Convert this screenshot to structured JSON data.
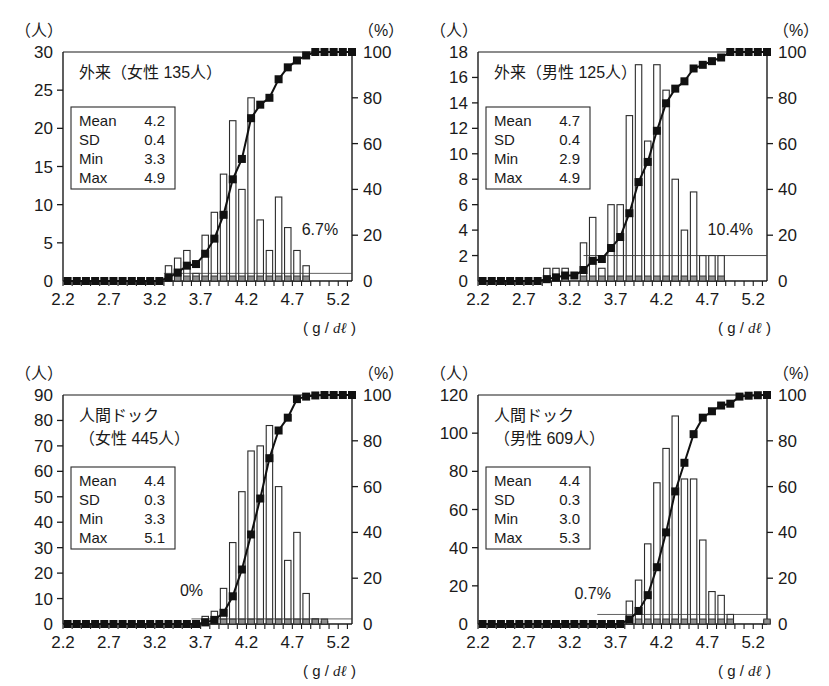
{
  "figure": {
    "panel_count": 4,
    "x_unit_label": "( g / dℓ )",
    "left_axis_unit": "（人）",
    "right_axis_unit": "（%）"
  },
  "chart_data": [
    {
      "type": "bar",
      "id": "outpatient-female",
      "title": "外来（女性 135人）",
      "title_lines": [
        "外来（女性 135人）"
      ],
      "xlabel": "( g / dℓ )",
      "ylabel": "（人）",
      "y2label": "（%）",
      "xlim": [
        2.2,
        5.35
      ],
      "ylim": [
        0,
        30
      ],
      "y2lim": [
        0,
        100
      ],
      "yticks": [
        0,
        5,
        10,
        15,
        20,
        25,
        30
      ],
      "y2ticks": [
        0,
        20,
        40,
        60,
        80,
        100
      ],
      "xticks_labeled": [
        "2.2",
        "2.7",
        "3.2",
        "3.7",
        "4.2",
        "4.7",
        "5.2"
      ],
      "xtick_step": 0.1,
      "grid": false,
      "annotation": "6.7%",
      "annotation_x": 5.0,
      "annotation_y": 6.0,
      "stats": {
        "Mean": "4.2",
        "SD": "0.4",
        "Min": "3.3",
        "Max": "4.9"
      },
      "stats_rows": [
        {
          "label": "Mean",
          "value": "4.2"
        },
        {
          "label": "SD",
          "value": "0.4"
        },
        {
          "label": "Min",
          "value": "3.3"
        },
        {
          "label": "Max",
          "value": "4.9"
        }
      ],
      "x": [
        2.2,
        2.3,
        2.4,
        2.5,
        2.6,
        2.7,
        2.8,
        2.9,
        3.0,
        3.1,
        3.2,
        3.3,
        3.4,
        3.5,
        3.6,
        3.7,
        3.8,
        3.9,
        4.0,
        4.1,
        4.2,
        4.3,
        4.4,
        4.5,
        4.6,
        4.7,
        4.8,
        4.9,
        5.0,
        5.1,
        5.2,
        5.3
      ],
      "values": [
        0,
        0,
        0,
        0,
        0,
        0,
        0,
        0,
        0,
        0,
        0,
        2,
        3,
        4,
        1,
        6,
        9,
        14,
        21,
        12,
        24,
        8,
        4,
        11,
        7,
        4,
        2,
        0,
        0,
        0,
        0,
        0
      ],
      "cumulative_percent": [
        0,
        0,
        0,
        0,
        0,
        0,
        0,
        0,
        0,
        0,
        0,
        1.5,
        3.7,
        6.7,
        7.4,
        11.9,
        18.5,
        28.9,
        44.4,
        53.3,
        71.1,
        77.0,
        80.0,
        88.1,
        93.3,
        96.3,
        98.5,
        100,
        100,
        100,
        100,
        100
      ],
      "series": [
        {
          "name": "人数 (frequency)",
          "type": "bar",
          "axis": "left"
        },
        {
          "name": "累積 (%)",
          "type": "line",
          "axis": "right",
          "marker": "filled-square"
        }
      ]
    },
    {
      "type": "bar",
      "id": "outpatient-male",
      "title": "外来（男性 125人）",
      "title_lines": [
        "外来（男性 125人）"
      ],
      "xlabel": "( g / dℓ )",
      "ylabel": "（人）",
      "y2label": "（%）",
      "xlim": [
        2.2,
        5.35
      ],
      "ylim": [
        0,
        18
      ],
      "y2lim": [
        0,
        100
      ],
      "yticks": [
        0,
        2,
        4,
        6,
        8,
        10,
        12,
        14,
        16,
        18
      ],
      "y2ticks": [
        0,
        20,
        40,
        60,
        80,
        100
      ],
      "xticks_labeled": [
        "2.2",
        "2.7",
        "3.2",
        "3.7",
        "4.2",
        "4.7",
        "5.2"
      ],
      "xtick_step": 0.1,
      "grid": false,
      "annotation": "10.4%",
      "annotation_x": 4.95,
      "annotation_y": 3.6,
      "stats": {
        "Mean": "4.7",
        "SD": "0.4",
        "Min": "2.9",
        "Max": "4.9"
      },
      "stats_rows": [
        {
          "label": "Mean",
          "value": "4.7"
        },
        {
          "label": "SD",
          "value": "0.4"
        },
        {
          "label": "Min",
          "value": "2.9"
        },
        {
          "label": "Max",
          "value": "4.9"
        }
      ],
      "x": [
        2.2,
        2.3,
        2.4,
        2.5,
        2.6,
        2.7,
        2.8,
        2.9,
        3.0,
        3.1,
        3.2,
        3.3,
        3.4,
        3.5,
        3.6,
        3.7,
        3.8,
        3.9,
        4.0,
        4.1,
        4.2,
        4.3,
        4.4,
        4.5,
        4.6,
        4.7,
        4.8,
        4.9,
        5.0,
        5.1,
        5.2,
        5.3
      ],
      "values": [
        0,
        0,
        0,
        0,
        0,
        0,
        0,
        1,
        1,
        1,
        0,
        3,
        5,
        1,
        6,
        6,
        13,
        17,
        11,
        17,
        15,
        8,
        4,
        7,
        2,
        2,
        2,
        0,
        0,
        0,
        0,
        0
      ],
      "cumulative_percent": [
        0,
        0,
        0,
        0,
        0,
        0,
        0,
        0.8,
        1.6,
        2.4,
        2.4,
        4.8,
        8.8,
        9.6,
        14.4,
        19.2,
        29.6,
        43.2,
        52.0,
        65.6,
        77.6,
        84.0,
        87.2,
        92.8,
        94.4,
        96.0,
        97.6,
        100,
        100,
        100,
        100,
        100
      ],
      "series": [
        {
          "name": "人数 (frequency)",
          "type": "bar",
          "axis": "left"
        },
        {
          "name": "累積 (%)",
          "type": "line",
          "axis": "right",
          "marker": "filled-square"
        }
      ]
    },
    {
      "type": "bar",
      "id": "health-checkup-female",
      "title": "人間ドック（女性 445人）",
      "title_lines": [
        "人間ドック",
        "（女性 445人）"
      ],
      "xlabel": "( g / dℓ )",
      "ylabel": "（人）",
      "y2label": "（%）",
      "xlim": [
        2.2,
        5.35
      ],
      "ylim": [
        0,
        90
      ],
      "y2lim": [
        0,
        100
      ],
      "yticks": [
        0,
        10,
        20,
        30,
        40,
        50,
        60,
        70,
        80,
        90
      ],
      "y2ticks": [
        0,
        20,
        40,
        60,
        80,
        100
      ],
      "xticks_labeled": [
        "2.2",
        "2.7",
        "3.2",
        "3.7",
        "4.2",
        "4.7",
        "5.2"
      ],
      "xtick_step": 0.1,
      "grid": false,
      "annotation": "0%",
      "annotation_x": 3.6,
      "annotation_y": 11.0,
      "stats": {
        "Mean": "4.4",
        "SD": "0.3",
        "Min": "3.3",
        "Max": "5.1"
      },
      "stats_rows": [
        {
          "label": "Mean",
          "value": "4.4"
        },
        {
          "label": "SD",
          "value": "0.3"
        },
        {
          "label": "Min",
          "value": "3.3"
        },
        {
          "label": "Max",
          "value": "5.1"
        }
      ],
      "x": [
        2.2,
        2.3,
        2.4,
        2.5,
        2.6,
        2.7,
        2.8,
        2.9,
        3.0,
        3.1,
        3.2,
        3.3,
        3.4,
        3.5,
        3.6,
        3.7,
        3.8,
        3.9,
        4.0,
        4.1,
        4.2,
        4.3,
        4.4,
        4.5,
        4.6,
        4.7,
        4.8,
        4.9,
        5.0,
        5.1,
        5.2,
        5.3
      ],
      "values": [
        0,
        0,
        0,
        0,
        0,
        0,
        0,
        0,
        0,
        0,
        0,
        0,
        0,
        0,
        0,
        3,
        5,
        14,
        32,
        52,
        68,
        70,
        78,
        54,
        25,
        36,
        12,
        2,
        1,
        0,
        0,
        0
      ],
      "cumulative_percent": [
        0,
        0,
        0,
        0,
        0,
        0,
        0,
        0,
        0,
        0,
        0,
        0,
        0,
        0,
        0,
        0.7,
        1.8,
        4.9,
        12.1,
        23.8,
        39.1,
        54.8,
        72.4,
        84.5,
        90.1,
        98.2,
        99.3,
        99.8,
        100,
        100,
        100,
        100
      ],
      "series": [
        {
          "name": "人数 (frequency)",
          "type": "bar",
          "axis": "left"
        },
        {
          "name": "累積 (%)",
          "type": "line",
          "axis": "right",
          "marker": "filled-square"
        }
      ]
    },
    {
      "type": "bar",
      "id": "health-checkup-male",
      "title": "人間ドック（男性 609人）",
      "title_lines": [
        "人間ドック",
        "（男性 609人）"
      ],
      "xlabel": "( g / dℓ )",
      "ylabel": "（人）",
      "y2label": "（%）",
      "xlim": [
        2.2,
        5.35
      ],
      "ylim": [
        0,
        120
      ],
      "y2lim": [
        0,
        100
      ],
      "yticks": [
        0,
        20,
        40,
        60,
        80,
        100,
        120
      ],
      "y2ticks": [
        0,
        20,
        40,
        60,
        80,
        100
      ],
      "xticks_labeled": [
        "2.2",
        "2.7",
        "3.2",
        "3.7",
        "4.2",
        "4.7",
        "5.2"
      ],
      "xtick_step": 0.1,
      "grid": false,
      "annotation": "0.7%",
      "annotation_x": 3.45,
      "annotation_y": 13.0,
      "stats": {
        "Mean": "4.4",
        "SD": "0.3",
        "Min": "3.0",
        "Max": "5.3"
      },
      "stats_rows": [
        {
          "label": "Mean",
          "value": "4.4"
        },
        {
          "label": "SD",
          "value": "0.3"
        },
        {
          "label": "Min",
          "value": "3.0"
        },
        {
          "label": "Max",
          "value": "5.3"
        }
      ],
      "x": [
        2.2,
        2.3,
        2.4,
        2.5,
        2.6,
        2.7,
        2.8,
        2.9,
        3.0,
        3.1,
        3.2,
        3.3,
        3.4,
        3.5,
        3.6,
        3.7,
        3.8,
        3.9,
        4.0,
        4.1,
        4.2,
        4.3,
        4.4,
        4.5,
        4.6,
        4.7,
        4.8,
        4.9,
        5.0,
        5.1,
        5.2,
        5.3
      ],
      "values": [
        0,
        0,
        0,
        0,
        0,
        0,
        0,
        0,
        0,
        0,
        0,
        0,
        0,
        0,
        0,
        0,
        12,
        23,
        42,
        74,
        92,
        109,
        76,
        76,
        44,
        17,
        15,
        5,
        0,
        0,
        0,
        2
      ],
      "cumulative_percent": [
        0,
        0,
        0,
        0,
        0,
        0,
        0,
        0,
        0,
        0,
        0,
        0,
        0,
        0,
        0,
        0,
        2.0,
        5.7,
        12.6,
        24.8,
        40.0,
        57.9,
        70.4,
        82.9,
        90.1,
        92.9,
        95.4,
        96.2,
        99.3,
        99.7,
        99.9,
        100
      ],
      "series": [
        {
          "name": "人数 (frequency)",
          "type": "bar",
          "axis": "left"
        },
        {
          "name": "累積 (%)",
          "type": "line",
          "axis": "right",
          "marker": "filled-square"
        }
      ]
    }
  ]
}
